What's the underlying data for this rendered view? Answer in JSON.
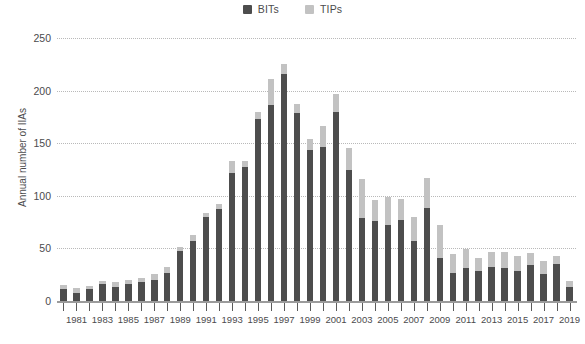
{
  "chart_data": {
    "type": "bar",
    "title": "",
    "subtitle": "",
    "xlabel": "",
    "ylabel": "Annual number of IIAs",
    "stacked": true,
    "grid": true,
    "legend_position": "top-center",
    "ylim": [
      0,
      250
    ],
    "yticks": [
      0,
      50,
      100,
      150,
      200,
      250
    ],
    "ytick_labels": [
      "0",
      "50",
      "100",
      "150",
      "200",
      "250"
    ],
    "categories": [
      "1980",
      "1981",
      "1982",
      "1983",
      "1984",
      "1985",
      "1986",
      "1987",
      "1988",
      "1989",
      "1990",
      "1991",
      "1992",
      "1993",
      "1994",
      "1995",
      "1996",
      "1997",
      "1998",
      "1999",
      "2000",
      "2001",
      "2002",
      "2003",
      "2004",
      "2005",
      "2006",
      "2007",
      "2008",
      "2009",
      "2010",
      "2011",
      "2012",
      "2013",
      "2014",
      "2015",
      "2016",
      "2017",
      "2018",
      "2019"
    ],
    "xtick_labels": [
      "",
      "1981",
      "",
      "1983",
      "",
      "1985",
      "",
      "1987",
      "",
      "1989",
      "",
      "1991",
      "",
      "1993",
      "",
      "1995",
      "",
      "1997",
      "",
      "1999",
      "",
      "2001",
      "",
      "2003",
      "",
      "2005",
      "",
      "2007",
      "",
      "2009",
      "",
      "2011",
      "",
      "2013",
      "",
      "2015",
      "",
      "2017",
      "",
      "2019"
    ],
    "series": [
      {
        "name": "BITs",
        "color": "#4d4d4d",
        "values": [
          11,
          8,
          11,
          16,
          13,
          16,
          18,
          20,
          27,
          48,
          57,
          80,
          87,
          122,
          127,
          173,
          186,
          216,
          179,
          144,
          146,
          180,
          125,
          79,
          76,
          72,
          77,
          57,
          88,
          41,
          27,
          31,
          29,
          32,
          31,
          29,
          34,
          26,
          35,
          13
        ]
      },
      {
        "name": "TIPs",
        "color": "#c2c2c2",
        "values": [
          4,
          4,
          3,
          3,
          5,
          4,
          4,
          6,
          5,
          3,
          6,
          4,
          5,
          11,
          6,
          7,
          25,
          9,
          8,
          10,
          20,
          17,
          20,
          37,
          20,
          27,
          20,
          23,
          29,
          31,
          18,
          18,
          12,
          15,
          16,
          14,
          12,
          12,
          8,
          6
        ]
      }
    ],
    "totals": [
      15,
      12,
      14,
      19,
      18,
      20,
      22,
      26,
      32,
      51,
      63,
      84,
      92,
      133,
      133,
      180,
      211,
      225,
      187,
      154,
      166,
      197,
      145,
      116,
      96,
      99,
      97,
      80,
      117,
      72,
      45,
      49,
      41,
      47,
      47,
      43,
      46,
      38,
      43,
      19
    ]
  },
  "legend": {
    "items": [
      {
        "label": "BITs",
        "color": "#4d4d4d"
      },
      {
        "label": "TIPs",
        "color": "#c2c2c2"
      }
    ]
  }
}
